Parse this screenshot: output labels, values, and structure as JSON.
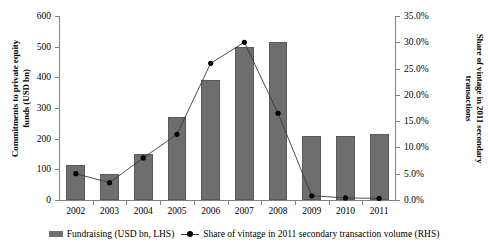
{
  "chart_data": {
    "type": "bar",
    "title": "",
    "subtitle": "",
    "xlabel": "",
    "ylabel": "Commitments to private equity funds (USD bn)",
    "y2label": "Share of vintage in 2011 secondary transactions",
    "categories": [
      "2002",
      "2003",
      "2004",
      "2005",
      "2006",
      "2007",
      "2008",
      "2009",
      "2010",
      "2011"
    ],
    "ylim": [
      0,
      600
    ],
    "y2lim": [
      0,
      35
    ],
    "yticks": [
      "0",
      "100",
      "200",
      "300",
      "400",
      "500",
      "600"
    ],
    "y2ticks": [
      "0.0%",
      "5.0%",
      "10.0%",
      "15.0%",
      "20.0%",
      "25.0%",
      "30.0%",
      "35.0%"
    ],
    "grid": false,
    "legend_position": "bottom",
    "series": [
      {
        "name": "Fundraising (USD bn, LHS)",
        "type": "bar",
        "axis": "left",
        "color": "#6e6e6e",
        "values": [
          115,
          85,
          150,
          270,
          390,
          500,
          515,
          210,
          210,
          215
        ]
      },
      {
        "name": "Share of vintage in 2011 secondary transaction volume (RHS)",
        "type": "line",
        "axis": "right",
        "color": "#3a3a3a",
        "marker": "filled-circle",
        "values": [
          5.0,
          3.3,
          8.0,
          12.5,
          26.0,
          30.0,
          16.5,
          0.8,
          0.4,
          0.3
        ]
      }
    ]
  },
  "axes": {
    "left_title": "Commitments to private equity funds (USD bn)",
    "right_title": "Share of vintage in 2011 secondary transactions"
  },
  "legend": {
    "items": [
      {
        "label": "Fundraising (USD bn, LHS)",
        "marker": "bar-swatch"
      },
      {
        "label": "Share of vintage in 2011 secondary transaction volume (RHS)",
        "marker": "line-marker-swatch"
      }
    ]
  }
}
